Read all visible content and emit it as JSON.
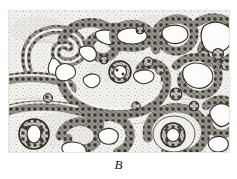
{
  "figure": {
    "label": "B",
    "panel_letter": "B",
    "kind": "histology-micrograph-drawing",
    "frame": {
      "x": 8,
      "y": 10,
      "width": 222,
      "height": 143
    },
    "canvas": {
      "width": 237,
      "height": 179
    }
  },
  "colors": {
    "page_background": "#ffffff",
    "tissue_background": "#f2f1ee",
    "stroma_stipple": "#8e8b86",
    "gland_outline": "#2a2724",
    "epithelial_cell_fill": "#6d6a64",
    "epithelial_cell_dark": "#38352f",
    "lumen_fill": "#fdfdfc",
    "label_text": "#1a1a1a"
  },
  "structures": {
    "glands": [
      {
        "name": "gland-upper-left-loop",
        "cx": 48,
        "cy": 42,
        "rx": 32,
        "ry": 25,
        "lumen": "slit"
      },
      {
        "name": "gland-upper-left-band",
        "cx": 24,
        "cy": 72,
        "rx": 24,
        "ry": 10,
        "lumen": "slit"
      },
      {
        "name": "gland-upper-mid-serpentine",
        "cx": 78,
        "cy": 33,
        "rx": 33,
        "ry": 22,
        "lumen": "branched"
      },
      {
        "name": "gland-upper-mid-right",
        "cx": 120,
        "cy": 32,
        "rx": 22,
        "ry": 14,
        "lumen": "oval"
      },
      {
        "name": "gland-upper-right-lobed",
        "cx": 166,
        "cy": 30,
        "rx": 24,
        "ry": 20,
        "lumen": "lobed"
      },
      {
        "name": "gland-right-margin-upper",
        "cx": 206,
        "cy": 34,
        "rx": 22,
        "ry": 24,
        "lumen": "lobed"
      },
      {
        "name": "gland-central-arc",
        "cx": 105,
        "cy": 80,
        "rx": 52,
        "ry": 26,
        "lumen": "arc"
      },
      {
        "name": "gland-central-round",
        "cx": 110,
        "cy": 66,
        "rx": 11,
        "ry": 10,
        "lumen": "round"
      },
      {
        "name": "gland-right-mid-ring",
        "cx": 191,
        "cy": 72,
        "rx": 25,
        "ry": 24,
        "lumen": "ring"
      },
      {
        "name": "gland-lower-left-band",
        "cx": 48,
        "cy": 104,
        "rx": 44,
        "ry": 9,
        "lumen": "slit"
      },
      {
        "name": "gland-lower-left-round",
        "cx": 28,
        "cy": 128,
        "rx": 14,
        "ry": 14,
        "lumen": "round"
      },
      {
        "name": "gland-lower-mid-serpentine",
        "cx": 100,
        "cy": 128,
        "rx": 38,
        "ry": 22,
        "lumen": "branched"
      },
      {
        "name": "gland-lower-right-round",
        "cx": 170,
        "cy": 128,
        "rx": 27,
        "ry": 22,
        "lumen": "round"
      },
      {
        "name": "gland-lower-right-margin",
        "cx": 212,
        "cy": 120,
        "rx": 20,
        "ry": 26,
        "lumen": "slit"
      }
    ]
  }
}
